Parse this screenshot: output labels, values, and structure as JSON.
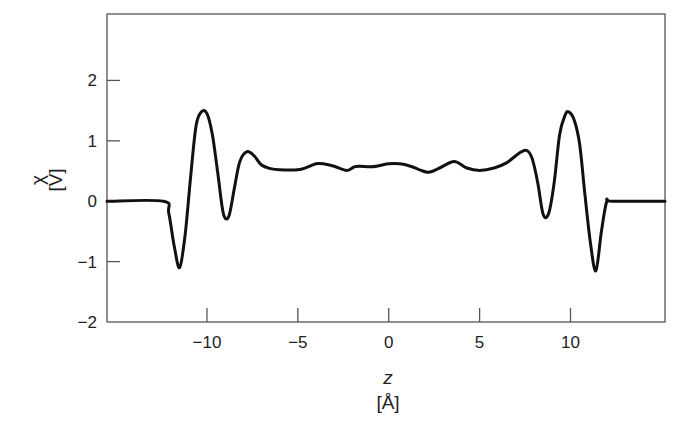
{
  "chart_data": {
    "type": "line",
    "title": "",
    "xlabel": "z",
    "xlabel_unit": "[Å]",
    "ylabel": "χ",
    "ylabel_unit": "[V]",
    "xlim": [
      -15.5,
      15.2
    ],
    "ylim": [
      -2,
      3.1
    ],
    "xticks": [
      -10,
      -5,
      0,
      5,
      10
    ],
    "xtick_labels": [
      "−10",
      "−5",
      "0",
      "5",
      "10"
    ],
    "yticks": [
      -2,
      -1,
      0,
      1,
      2
    ],
    "ytick_labels": [
      "−2",
      "−1",
      "0",
      "1",
      "2"
    ],
    "grid": false,
    "legend": null,
    "series": [
      {
        "name": "χ(z)",
        "color": "#111111",
        "x": [
          -15.5,
          -12.4,
          -12.1,
          -11.8,
          -11.5,
          -11.2,
          -10.9,
          -10.6,
          -10.3,
          -10.0,
          -9.7,
          -9.4,
          -9.1,
          -8.8,
          -8.5,
          -8.2,
          -7.8,
          -7.4,
          -7.0,
          -6.5,
          -6.0,
          -5.0,
          -4.5,
          -4.0,
          -3.6,
          -3.0,
          -2.3,
          -1.9,
          -1.6,
          -1.0,
          -0.5,
          0.0,
          0.6,
          1.2,
          1.7,
          2.2,
          2.8,
          3.6,
          4.3,
          5.0,
          5.8,
          6.5,
          7.2,
          7.6,
          7.9,
          8.2,
          8.5,
          8.8,
          9.1,
          9.4,
          9.7,
          9.9,
          10.2,
          10.5,
          10.8,
          11.1,
          11.4,
          11.7,
          12.0,
          12.3,
          15.2
        ],
        "y": [
          0.0,
          0.0,
          -0.2,
          -0.75,
          -1.1,
          -0.55,
          0.4,
          1.25,
          1.48,
          1.45,
          1.1,
          0.45,
          -0.2,
          -0.25,
          0.2,
          0.65,
          0.82,
          0.75,
          0.6,
          0.54,
          0.52,
          0.52,
          0.56,
          0.62,
          0.62,
          0.58,
          0.51,
          0.57,
          0.58,
          0.57,
          0.59,
          0.62,
          0.62,
          0.58,
          0.52,
          0.48,
          0.55,
          0.66,
          0.55,
          0.51,
          0.55,
          0.64,
          0.8,
          0.84,
          0.7,
          0.3,
          -0.22,
          -0.2,
          0.3,
          1.1,
          1.42,
          1.48,
          1.35,
          0.95,
          0.1,
          -0.7,
          -1.15,
          -0.5,
          0.0,
          0.0,
          0.0
        ]
      }
    ]
  }
}
